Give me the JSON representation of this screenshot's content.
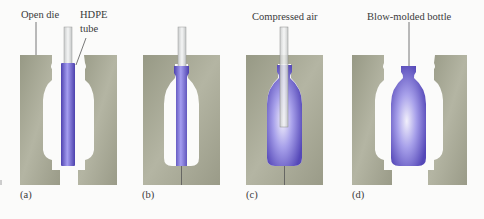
{
  "figure": {
    "panels": [
      {
        "id": "a",
        "label": "(a)",
        "callouts": [
          "Open die",
          "HDPE",
          "tube"
        ]
      },
      {
        "id": "b",
        "label": "(b)"
      },
      {
        "id": "c",
        "label": "(c)",
        "callouts": [
          "Compressed air"
        ]
      },
      {
        "id": "d",
        "label": "(d)",
        "callouts": [
          "Blow-molded bottle"
        ]
      }
    ],
    "colors": {
      "die": "#a9aa97",
      "die_dark": "#8f917c",
      "plastic": "#6a5fc9",
      "plastic_light": "#b8b3ee",
      "tube": "#e2e4e4",
      "background": "#fbfbfa"
    }
  }
}
